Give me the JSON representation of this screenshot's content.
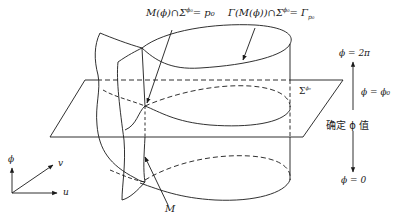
{
  "figure": {
    "labels": {
      "p0_label": "M(ϕ)∩Σ^ϕ₀ = p₀",
      "p0_label_parts": {
        "left": "M(ϕ)∩Σ",
        "sup": "ϕ₀",
        "right": "= p₀"
      },
      "gamma_label": "Γ(M(ϕ))∩Σ^ϕ₀ = Γ_p₀",
      "gamma_label_parts": {
        "left": "Γ(M(ϕ))∩Σ",
        "sup": "ϕ₀",
        "right": "= Γ",
        "sub": "p₀"
      },
      "plane_label": {
        "base": "Σ",
        "sup": "ϕ₀"
      },
      "surface_label": "M",
      "phi_top": "ϕ = 2π",
      "phi_mid": "ϕ = ϕ₀",
      "phi_fix": "确定 ϕ 值",
      "phi_bottom": "ϕ = 0"
    },
    "axes": {
      "vertical": "ϕ",
      "diagonal": "v",
      "horizontal": "u"
    },
    "colors": {
      "stroke": "#1a1a1a",
      "background": "#ffffff"
    }
  }
}
